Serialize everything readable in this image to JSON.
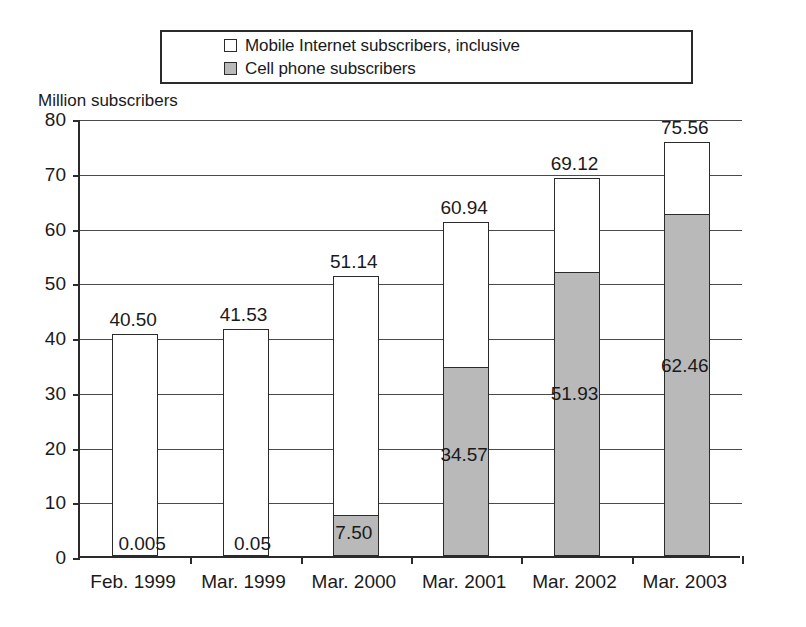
{
  "legend": {
    "entries": [
      {
        "label": "Mobile Internet subscribers, inclusive",
        "swatch": "white"
      },
      {
        "label": "Cell phone subscribers",
        "swatch": "gray"
      }
    ]
  },
  "axis": {
    "y_title": "Million subscribers",
    "y_ticks": [
      "80",
      "70",
      "60",
      "50",
      "40",
      "30",
      "20",
      "10",
      "0"
    ]
  },
  "chart_data": {
    "type": "bar",
    "title": "",
    "subtitle": "",
    "xlabel": "",
    "ylabel": "Million subscribers",
    "ylim": [
      0,
      80
    ],
    "ytick_step": 10,
    "grid": true,
    "stacked": true,
    "legend_position": "top",
    "categories": [
      "Feb. 1999",
      "Mar. 1999",
      "Mar. 2000",
      "Mar. 2001",
      "Mar. 2002",
      "Mar. 2003"
    ],
    "series": [
      {
        "name": "Cell phone subscribers",
        "color": "#b9b9b9",
        "values": [
          0.005,
          0.05,
          7.5,
          34.57,
          51.93,
          62.46
        ],
        "labels": [
          "0.005",
          "0.05",
          "7.50",
          "34.57",
          "51.93",
          "62.46"
        ]
      },
      {
        "name": "Mobile Internet subscribers, inclusive",
        "color": "#ffffff",
        "values": [
          40.5,
          41.53,
          51.14,
          60.94,
          69.12,
          75.56
        ],
        "labels": [
          "40.50",
          "41.53",
          "51.14",
          "60.94",
          "69.12",
          "75.56"
        ],
        "note": "total bar height (inclusive of cell phone subscribers)"
      }
    ],
    "totals": [
      40.5,
      41.53,
      51.14,
      60.94,
      69.12,
      75.56
    ],
    "total_labels": [
      "40.50",
      "41.53",
      "51.14",
      "60.94",
      "69.12",
      "75.56"
    ]
  },
  "colors": {
    "bar_fill_white": "#ffffff",
    "bar_fill_gray": "#b9b9b9",
    "stroke": "#2b2b2b",
    "grid": "#4a4a4a",
    "background": "#ffffff"
  }
}
